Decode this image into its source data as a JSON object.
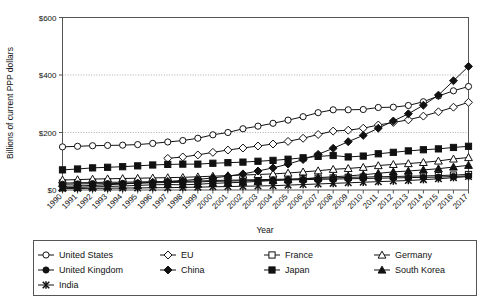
{
  "chart_data": {
    "type": "line",
    "title": "",
    "xlabel": "Year",
    "ylabel": "Billions of current PPP dollars",
    "xlim": [
      1990,
      2017
    ],
    "ylim": [
      0,
      600
    ],
    "yticks": [
      0,
      200,
      400,
      600
    ],
    "ytick_labels": [
      "$0",
      "$200",
      "$400",
      "$600"
    ],
    "grid": "horizontal-dotted",
    "legend_position": "below-axes",
    "legend_columns": 4,
    "x": [
      1990,
      1991,
      1992,
      1993,
      1994,
      1995,
      1996,
      1997,
      1998,
      1999,
      2000,
      2001,
      2002,
      2003,
      2004,
      2005,
      2006,
      2007,
      2008,
      2009,
      2010,
      2011,
      2012,
      2013,
      2014,
      2015,
      2016,
      2017
    ],
    "categories": [
      "1990",
      "1991",
      "1992",
      "1993",
      "1994",
      "1995",
      "1996",
      "1997",
      "1998",
      "1999",
      "2000",
      "2001",
      "2002",
      "2003",
      "2004",
      "2005",
      "2006",
      "2007",
      "2008",
      "2009",
      "2010",
      "2011",
      "2012",
      "2013",
      "2014",
      "2015",
      "2016",
      "2017"
    ],
    "series": [
      {
        "name": "United States",
        "marker": "open-circle",
        "values": [
          150,
          152,
          154,
          155,
          156,
          158,
          162,
          167,
          172,
          180,
          192,
          200,
          213,
          222,
          232,
          243,
          255,
          269,
          279,
          279,
          280,
          287,
          288,
          294,
          307,
          327,
          345,
          360
        ]
      },
      {
        "name": "EU",
        "marker": "open-diamond",
        "values": [
          null,
          null,
          null,
          null,
          null,
          null,
          null,
          110,
          115,
          122,
          131,
          139,
          146,
          153,
          160,
          169,
          180,
          193,
          205,
          208,
          215,
          226,
          235,
          244,
          257,
          272,
          288,
          305
        ]
      },
      {
        "name": "France",
        "marker": "open-square",
        "values": [
          24,
          25,
          26,
          27,
          27,
          28,
          29,
          29,
          30,
          31,
          33,
          34,
          35,
          36,
          37,
          38,
          39,
          41,
          42,
          44,
          45,
          46,
          47,
          48,
          49,
          50,
          52,
          54
        ]
      },
      {
        "name": "Germany",
        "marker": "open-triangle",
        "values": [
          35,
          36,
          38,
          39,
          40,
          41,
          42,
          43,
          44,
          46,
          48,
          50,
          52,
          54,
          56,
          59,
          63,
          67,
          72,
          75,
          79,
          85,
          89,
          92,
          96,
          101,
          108,
          113
        ]
      },
      {
        "name": "United Kingdom",
        "marker": "filled-circle",
        "values": [
          20,
          21,
          22,
          22,
          23,
          24,
          25,
          26,
          27,
          28,
          30,
          31,
          32,
          33,
          34,
          35,
          36,
          37,
          38,
          39,
          40,
          41,
          42,
          43,
          44,
          45,
          47,
          49
        ]
      },
      {
        "name": "China",
        "marker": "filled-diamond",
        "values": [
          13,
          14,
          16,
          18,
          21,
          24,
          27,
          30,
          33,
          37,
          42,
          48,
          56,
          66,
          77,
          90,
          106,
          124,
          145,
          168,
          190,
          215,
          240,
          265,
          295,
          330,
          380,
          430
        ]
      },
      {
        "name": "Japan",
        "marker": "filled-square",
        "values": [
          70,
          73,
          77,
          79,
          81,
          84,
          87,
          89,
          90,
          90,
          93,
          95,
          97,
          100,
          103,
          107,
          112,
          117,
          120,
          115,
          118,
          126,
          131,
          136,
          140,
          143,
          148,
          152
        ]
      },
      {
        "name": "South Korea",
        "marker": "filled-triangle",
        "values": [
          8,
          9,
          11,
          12,
          14,
          16,
          18,
          19,
          18,
          20,
          23,
          25,
          27,
          30,
          33,
          36,
          39,
          43,
          46,
          49,
          53,
          58,
          63,
          66,
          70,
          74,
          80,
          86
        ]
      },
      {
        "name": "India",
        "marker": "x-bar",
        "values": [
          5,
          5,
          6,
          6,
          7,
          7,
          8,
          8,
          9,
          10,
          11,
          12,
          13,
          14,
          15,
          17,
          19,
          21,
          23,
          25,
          27,
          29,
          31,
          33,
          36,
          39,
          43,
          47
        ]
      }
    ]
  },
  "legend": {
    "entries": [
      {
        "label": "United States",
        "marker": "open-circle"
      },
      {
        "label": "EU",
        "marker": "open-diamond"
      },
      {
        "label": "France",
        "marker": "open-square"
      },
      {
        "label": "Germany",
        "marker": "open-triangle"
      },
      {
        "label": "United Kingdom",
        "marker": "filled-circle"
      },
      {
        "label": "China",
        "marker": "filled-diamond"
      },
      {
        "label": "Japan",
        "marker": "filled-square"
      },
      {
        "label": "South Korea",
        "marker": "filled-triangle"
      },
      {
        "label": "India",
        "marker": "x-bar"
      }
    ]
  }
}
